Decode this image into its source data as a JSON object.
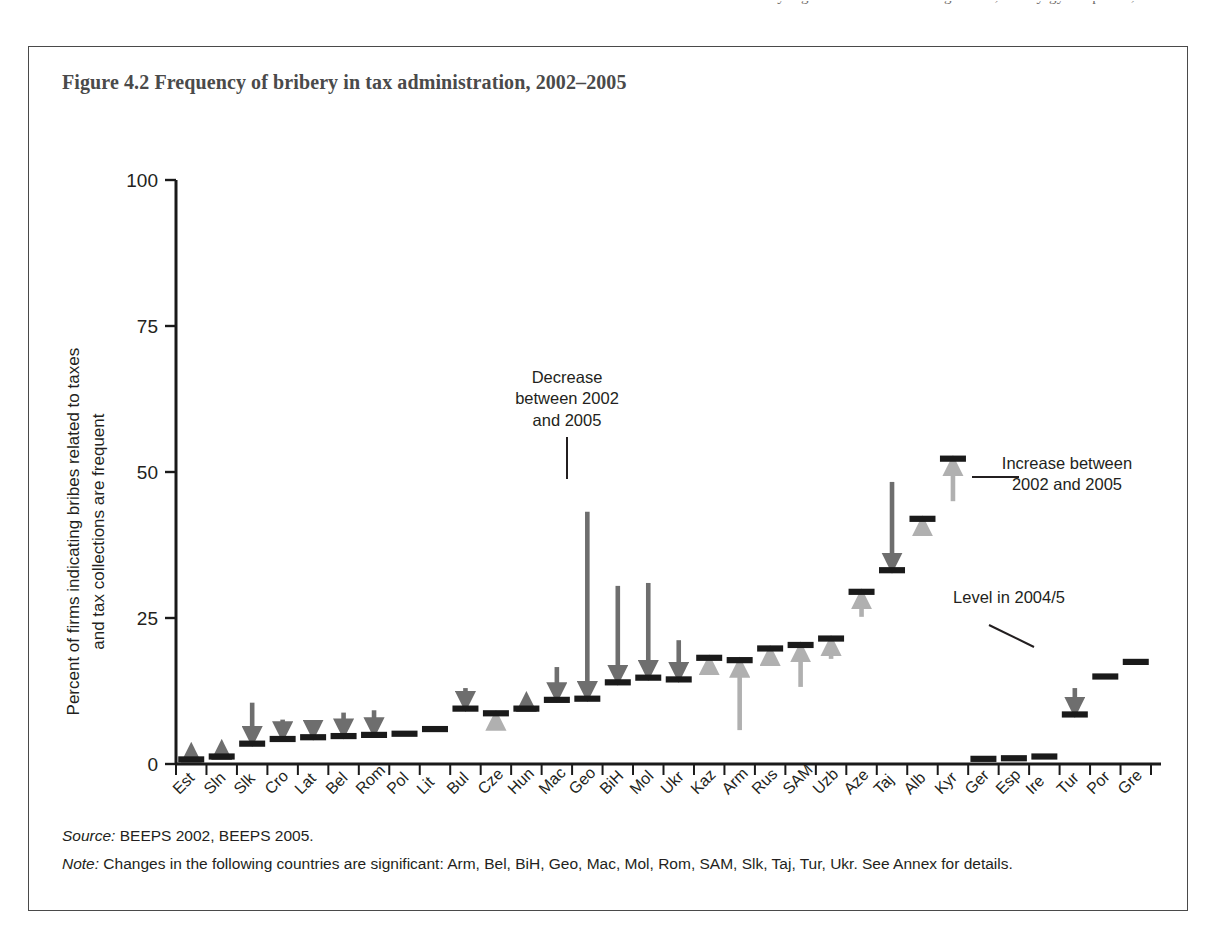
{
  "page": {
    "ghost_line": "by region. As is shown in Figure 4.2, the Kyrgyz Republic,"
  },
  "figure": {
    "title": "Figure 4.2  Frequency of bribery in tax administration, 2002–2005",
    "source_label": "Source:",
    "source_text": " BEEPS 2002, BEEPS 2005.",
    "note_label": "Note:",
    "note_text": " Changes in the following countries are significant: Arm, Bel, BiH, Geo, Mac, Mol, Rom, SAM, Slk, Taj, Tur, Ukr. See Annex for details."
  },
  "annotations": {
    "decrease": "Decrease\nbetween 2002\nand 2005",
    "decrease_line1": "Decrease",
    "decrease_line2": "between 2002",
    "decrease_line3": "and 2005",
    "increase_line1": "Increase between",
    "increase_line2": "2002 and 2005",
    "level": "Level in 2004/5"
  },
  "colors": {
    "level_bar": "#1a1a1a",
    "decrease_arrow": "#6e6e6e",
    "increase_arrow": "#b0b0b0",
    "axis": "#1a1a1a",
    "title": "#4a4a4a",
    "frame": "#4a4a4a"
  },
  "chart_data": {
    "type": "bar",
    "title": "Figure 4.2  Frequency of bribery in tax administration, 2002–2005",
    "xlabel": "",
    "ylabel": "Percent of firms indicating bribes related to taxes and tax collections are frequent",
    "ylim": [
      0,
      100
    ],
    "yticks": [
      0,
      25,
      50,
      75,
      100
    ],
    "ytick_labels": [
      "0",
      "25",
      "50",
      "75",
      "100"
    ],
    "grid": false,
    "legend_position": "inline-annotations",
    "series_names": [
      "Level in 2004/5",
      "Level in 2002"
    ],
    "categories": [
      "Est",
      "Sln",
      "Slk",
      "Cro",
      "Lat",
      "Bel",
      "Rom",
      "Pol",
      "Lit",
      "Bul",
      "Cze",
      "Hun",
      "Mac",
      "Geo",
      "BiH",
      "Mol",
      "Ukr",
      "Kaz",
      "Arm",
      "Rus",
      "SAM",
      "Uzb",
      "Aze",
      "Taj",
      "Alb",
      "Kyr",
      "Ger",
      "Esp",
      "Ire",
      "Tur",
      "Por",
      "Gre"
    ],
    "values_2005": [
      0.8,
      1.3,
      3.5,
      4.3,
      4.6,
      4.8,
      5.0,
      5.2,
      6.0,
      9.5,
      8.7,
      9.5,
      11.0,
      11.2,
      14.0,
      14.8,
      14.5,
      18.2,
      17.8,
      19.8,
      20.4,
      21.5,
      29.5,
      33.2,
      42.0,
      52.3,
      0.9,
      1.0,
      1.3,
      8.5,
      15.0,
      17.5
    ],
    "values_2002": [
      1.6,
      2.4,
      10.5,
      7.6,
      5.8,
      8.8,
      9.2,
      5.2,
      6.0,
      13.0,
      7.5,
      10.2,
      16.6,
      43.2,
      30.5,
      31.0,
      21.2,
      16.8,
      5.8,
      18.6,
      13.2,
      18.0,
      25.2,
      48.3,
      40.8,
      45.0,
      0.9,
      1.0,
      1.3,
      13.0,
      15.0,
      17.5
    ],
    "directions": [
      "decrease",
      "decrease",
      "decrease",
      "decrease",
      "decrease",
      "decrease",
      "decrease",
      "none",
      "none",
      "decrease",
      "increase",
      "decrease",
      "decrease",
      "decrease",
      "decrease",
      "decrease",
      "decrease",
      "increase",
      "increase",
      "increase",
      "increase",
      "increase",
      "increase",
      "decrease",
      "increase",
      "increase",
      "none",
      "none",
      "none",
      "decrease",
      "none",
      "none"
    ]
  }
}
